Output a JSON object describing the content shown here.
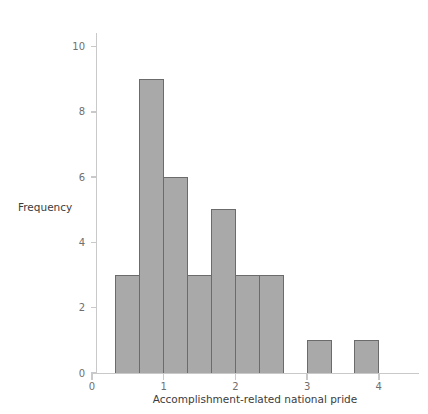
{
  "figure": {
    "width": 428,
    "height": 414,
    "background": "#ffffff"
  },
  "style": {
    "bar_fill": "#a9a9a9",
    "bar_stroke": "#6b6b6b",
    "axis_color": "#c9c9c9",
    "tick_label_color": "#6f6f6f",
    "axis_title_color": "#3c3c3c"
  },
  "chart_data": {
    "type": "bar",
    "title": "",
    "subtitle": "",
    "xlabel": "Accomplishment-related national pride",
    "ylabel": "Frequency",
    "xlim": [
      0,
      4.6
    ],
    "ylim": [
      0,
      10.8
    ],
    "xticks": [
      "0",
      "1",
      "2",
      "3",
      "4"
    ],
    "xtick_values": [
      0,
      1,
      2,
      3,
      4
    ],
    "yticks": [
      "0",
      "2",
      "4",
      "6",
      "8",
      "10"
    ],
    "ytick_values": [
      0,
      2,
      4,
      6,
      8,
      10
    ],
    "grid": false,
    "legend": false,
    "legend_position": "none",
    "bin_width": 0.3333,
    "bin_edges": [
      0.3333,
      0.6667,
      1.0,
      1.3333,
      1.6667,
      2.0,
      2.3333,
      2.6667,
      3.0,
      3.3333,
      3.6667,
      4.0,
      4.3333
    ],
    "bins": [
      {
        "left": 0.3333,
        "right": 0.6667,
        "center": 0.5,
        "value": 3
      },
      {
        "left": 0.6667,
        "right": 1.0,
        "center": 0.8333,
        "value": 9
      },
      {
        "left": 1.0,
        "right": 1.3333,
        "center": 1.1667,
        "value": 6
      },
      {
        "left": 1.3333,
        "right": 1.6667,
        "center": 1.5,
        "value": 3
      },
      {
        "left": 1.6667,
        "right": 2.0,
        "center": 1.8333,
        "value": 5
      },
      {
        "left": 2.0,
        "right": 2.3333,
        "center": 2.1667,
        "value": 3
      },
      {
        "left": 2.3333,
        "right": 2.6667,
        "center": 2.5,
        "value": 3
      },
      {
        "left": 2.6667,
        "right": 3.0,
        "center": 2.8333,
        "value": 0
      },
      {
        "left": 3.0,
        "right": 3.3333,
        "center": 3.1667,
        "value": 1
      },
      {
        "left": 3.3333,
        "right": 3.6667,
        "center": 3.5,
        "value": 0
      },
      {
        "left": 3.6667,
        "right": 4.0,
        "center": 3.8333,
        "value": 1
      }
    ],
    "categories": [
      "0.33-0.67",
      "0.67-1.00",
      "1.00-1.33",
      "1.33-1.67",
      "1.67-2.00",
      "2.00-2.33",
      "2.33-2.67",
      "2.67-3.00",
      "3.00-3.33",
      "3.33-3.67",
      "3.67-4.00"
    ],
    "values": [
      3,
      9,
      6,
      3,
      5,
      3,
      3,
      0,
      1,
      0,
      1
    ],
    "total_count": 34
  }
}
